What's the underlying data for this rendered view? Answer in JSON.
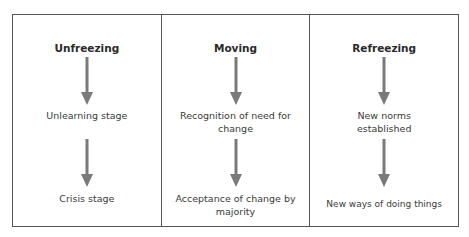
{
  "diagram": {
    "type": "three-stage process flow (Lewin's change model)",
    "colors": {
      "border": "#555555",
      "arrow": "#7a7a7a",
      "text": "#2a2a2a"
    },
    "stages": [
      {
        "title": "Unfreezing",
        "steps": [
          "Unlearning stage",
          "Crisis stage"
        ]
      },
      {
        "title": "Moving",
        "steps": [
          "Recognition of need for change",
          "Acceptance of change by majority"
        ]
      },
      {
        "title": "Refreezing",
        "steps": [
          "New norms established",
          "New ways of doing things"
        ]
      }
    ]
  }
}
